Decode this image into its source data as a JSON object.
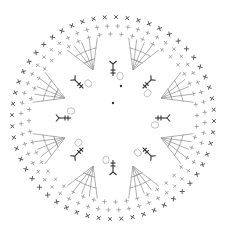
{
  "diagram": {
    "type": "crochet-chart",
    "shape": "circle",
    "center": [
      113,
      118
    ],
    "colors": {
      "outer_stitch": "#555555",
      "inner_stitch": "#9a9a9a",
      "accent_stitch": "#333333",
      "chain_ring": "#a8a8a8",
      "background": "#ffffff"
    },
    "rounds": [
      {
        "name": "outer-round",
        "symbol": "single-crochet-x",
        "radius": 101,
        "count": 56
      },
      {
        "name": "round-5",
        "symbol": "single-crochet-plus",
        "radius": 92,
        "count": 56
      },
      {
        "name": "round-4",
        "symbol": "single-crochet-plus",
        "radius": 84,
        "count": 48
      }
    ],
    "wedges": {
      "count": 8,
      "symbol": "double-crochet-fan",
      "inner_radius": 52,
      "outer_radius": 82,
      "rows_per_wedge": 4
    },
    "accent_clusters": {
      "count": 8,
      "symbol": "dark-treble-with-chain",
      "radius": 48
    },
    "center_marks": [
      {
        "x": 121,
        "y": 86
      },
      {
        "x": 113,
        "y": 103
      }
    ]
  }
}
